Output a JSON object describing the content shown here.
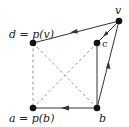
{
  "diagram": {
    "type": "directed-graph",
    "colors": {
      "solid_edge": "#333333",
      "dashed_edge": "#9a9a9a",
      "node": "#111111",
      "background": "#ffffff"
    },
    "nodes": [
      {
        "id": "v",
        "label": "v",
        "x": 119,
        "y": 21
      },
      {
        "id": "d",
        "label": "d = p(v)",
        "x": 33,
        "y": 43
      },
      {
        "id": "c",
        "label": "c",
        "x": 97,
        "y": 43
      },
      {
        "id": "a",
        "label": "a = p(b)",
        "x": 33,
        "y": 108
      },
      {
        "id": "b",
        "label": "b",
        "x": 97,
        "y": 108
      }
    ],
    "edges": [
      {
        "from": "v",
        "to": "d",
        "style": "solid",
        "arrow": true
      },
      {
        "from": "v",
        "to": "c",
        "style": "solid",
        "arrow": true
      },
      {
        "from": "b",
        "to": "v",
        "style": "solid",
        "arrow": true
      },
      {
        "from": "b",
        "to": "a",
        "style": "solid",
        "arrow": true
      },
      {
        "from": "c",
        "to": "b",
        "style": "solid",
        "arrow": false
      },
      {
        "from": "d",
        "to": "a",
        "style": "dashed",
        "arrow": false
      },
      {
        "from": "d",
        "to": "b",
        "style": "dashed",
        "arrow": false
      },
      {
        "from": "a",
        "to": "c",
        "style": "dashed",
        "arrow": false
      }
    ],
    "labels": {
      "v": "v",
      "d": "d = p(v)",
      "c": "c",
      "a": "a = p(b)",
      "b": "b"
    }
  }
}
